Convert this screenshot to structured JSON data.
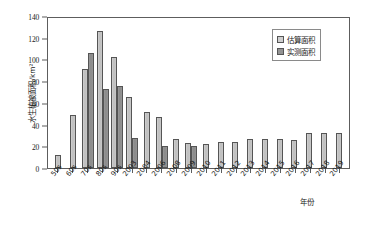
{
  "chart_data": {
    "type": "bar",
    "title": "",
    "xlabel": "年份",
    "ylabel": "水生植被面积/km²",
    "ylim": [
      0,
      140
    ],
    "yticks": [
      0,
      20,
      40,
      60,
      80,
      100,
      120,
      140
    ],
    "grid": false,
    "legend_position": "top-right",
    "categories": [
      "50s",
      "60s",
      "70s",
      "80s",
      "90s",
      "2003",
      "2004",
      "2006",
      "2008",
      "2009",
      "2010",
      "2011",
      "2012",
      "2013",
      "2014",
      "2015",
      "2016",
      "2017",
      "2018",
      "2019"
    ],
    "series": [
      {
        "name": "估算面积",
        "color": "#cfcfcf",
        "values": [
          12,
          49,
          91,
          126,
          102,
          65,
          52,
          47,
          27,
          23,
          22,
          24,
          24,
          27,
          27,
          27,
          26,
          32,
          32,
          32
        ]
      },
      {
        "name": "实测面积",
        "color": "#939393",
        "values": [
          null,
          null,
          106,
          73,
          76,
          28,
          null,
          20,
          null,
          20,
          null,
          null,
          null,
          null,
          null,
          null,
          null,
          null,
          null,
          null
        ]
      }
    ]
  },
  "axes": {
    "y_title": "水生植被面积/km²",
    "x_title": "年份",
    "y_tick_labels": [
      "0",
      "20",
      "40",
      "60",
      "80",
      "100",
      "120",
      "140"
    ]
  },
  "legend": {
    "items": [
      {
        "label": "估算面积",
        "swatch": "est"
      },
      {
        "label": "实测面积",
        "swatch": "meas"
      }
    ]
  },
  "caption": {
    "text": ""
  }
}
